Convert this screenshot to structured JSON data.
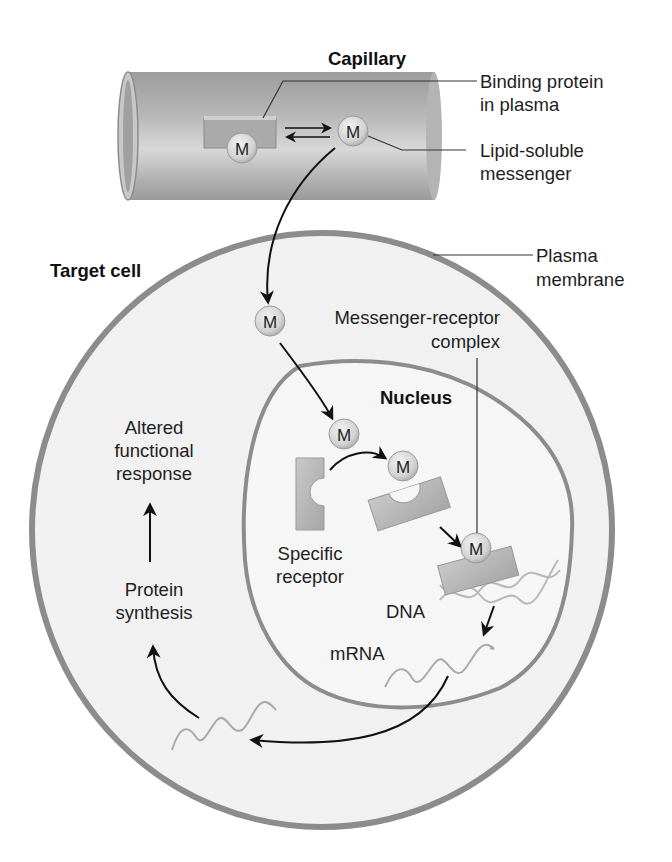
{
  "diagram": {
    "type": "lipid-soluble messenger mechanism of action",
    "labels": {
      "capillary": "Capillary",
      "binding_protein_line1": "Binding protein",
      "binding_protein_line2": "in plasma",
      "lipid_soluble_line1": "Lipid-soluble",
      "lipid_soluble_line2": "messenger",
      "plasma_membrane_line1": "Plasma",
      "plasma_membrane_line2": "membrane",
      "target_cell": "Target cell",
      "complex_line1": "Messenger-receptor",
      "complex_line2": "complex",
      "nucleus": "Nucleus",
      "altered_line1": "Altered",
      "altered_line2": "functional",
      "altered_line3": "response",
      "specific_line1": "Specific",
      "specific_line2": "receptor",
      "protein_line1": "Protein",
      "protein_line2": "synthesis",
      "dna": "DNA",
      "mrna": "mRNA"
    },
    "messenger_symbol": "M",
    "colors": {
      "capillary": "#a9a9a9",
      "membrane": "#8a8a8a",
      "cell_fill": "#f1f1f1",
      "nucleus_fill": "#f6f6f6",
      "receptor": "#b3b3b3",
      "messenger": "#d9d9d9",
      "arrow": "#111111"
    }
  }
}
